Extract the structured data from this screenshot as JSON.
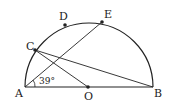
{
  "diagram": {
    "type": "semicircle geometry figure",
    "points": {
      "A": "A",
      "B": "B",
      "O": "O",
      "C": "C",
      "D": "D",
      "E": "E"
    },
    "angle_label": "39°",
    "segments": [
      "AB",
      "AE",
      "CB",
      "CO"
    ],
    "colors": {
      "stroke": "#222222",
      "background": "#ffffff"
    }
  }
}
